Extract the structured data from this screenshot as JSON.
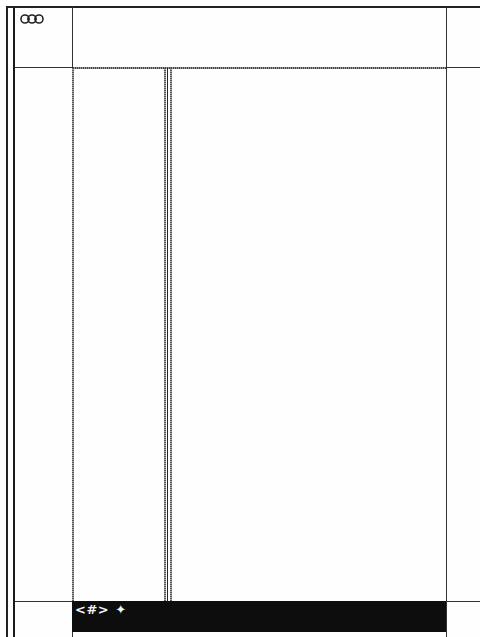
{
  "window": {
    "logo_icon": "linked-rings-icon"
  },
  "frames": {
    "header_left": {
      "content": ""
    },
    "header_main": {
      "content": ""
    },
    "header_right": {
      "content": ""
    },
    "nav_left": {
      "content": ""
    },
    "list_pane": {
      "content": ""
    },
    "content_pane": {
      "content": ""
    },
    "right_margin": {
      "content": ""
    }
  },
  "bottom_bar": {
    "nav_label": "<#>",
    "star_icon": "✦",
    "background": "#0d0d0d",
    "text_color": "#f2f2f2"
  },
  "colors": {
    "border": "#333333",
    "background": "#fefefe"
  }
}
